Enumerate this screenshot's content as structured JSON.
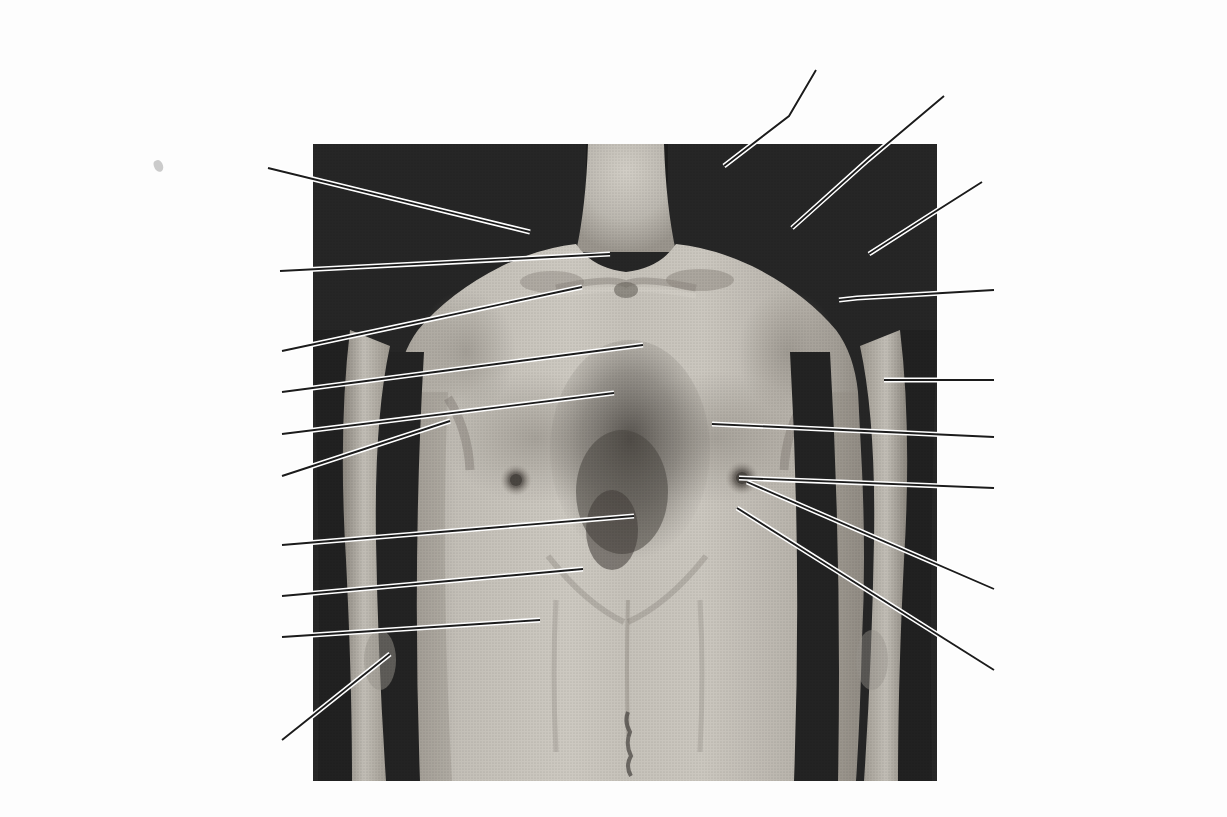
{
  "figure": {
    "background_color": "#fdfdfd",
    "text_color": "#1b1b1b",
    "leader_color": "#1b1b1b",
    "leader_halo_color": "#ffffff"
  },
  "photo": {
    "name": "anterior-thorax-photograph",
    "x": 313,
    "y": 144,
    "width": 624,
    "height": 637,
    "backdrop_color": "#262626",
    "skin_color": "#b9b5ae",
    "shadow_color": "#8d8880",
    "hair_color": "#4a4642"
  },
  "labels": [
    {
      "id": "supraclavicular-fossa",
      "text": [
        "supraclavicular",
        "fossa"
      ],
      "align": "centered",
      "x": 756,
      "y": 36,
      "width": 170
    },
    {
      "id": "clavicle",
      "text": [
        "clavicle"
      ],
      "align": "left",
      "x": 935,
      "y": 78,
      "width": 90
    },
    {
      "id": "trapezius",
      "text": [
        "trapezius"
      ],
      "align": "right",
      "x": 100,
      "y": 157,
      "width": 170
    },
    {
      "id": "acromion-process",
      "text": [
        "acromion process"
      ],
      "align": "left",
      "x": 990,
      "y": 177,
      "width": 180
    },
    {
      "id": "tendon-of-sternocleidomastoid",
      "text": [
        "tendon of",
        "sternocleidomastoid"
      ],
      "align": "right",
      "x": 82,
      "y": 234,
      "width": 188
    },
    {
      "id": "sternal-angle",
      "text": [
        "sternal angle",
        "(angle of Louis)"
      ],
      "align": "left",
      "x": 1003,
      "y": 272,
      "width": 170
    },
    {
      "id": "suprasternal-notch",
      "text": [
        "suprasternal notch"
      ],
      "align": "right",
      "x": 102,
      "y": 341,
      "width": 168
    },
    {
      "id": "deltoid",
      "text": [
        "deltoid"
      ],
      "align": "left",
      "x": 1003,
      "y": 368,
      "width": 90
    },
    {
      "id": "manubrium-sterni",
      "text": [
        "manubrium sterni"
      ],
      "align": "right",
      "x": 112,
      "y": 382,
      "width": 158
    },
    {
      "id": "body-of-sternum",
      "text": [
        "body of sternum"
      ],
      "align": "right",
      "x": 103,
      "y": 424,
      "width": 167
    },
    {
      "id": "pectoralis-major",
      "text": [
        "pectoralis major"
      ],
      "align": "left",
      "x": 1003,
      "y": 425,
      "width": 170
    },
    {
      "id": "anterior-axillary-fold",
      "text": [
        "anterior",
        "axillary fold"
      ],
      "align": "right",
      "x": 112,
      "y": 452,
      "width": 158
    },
    {
      "id": "nipple",
      "text": [
        "nipple"
      ],
      "align": "left",
      "x": 1003,
      "y": 476,
      "width": 90
    },
    {
      "id": "xiphoid-process",
      "text": [
        "xiphoid process"
      ],
      "align": "right",
      "x": 103,
      "y": 534,
      "width": 157
    },
    {
      "id": "costal-margin",
      "text": [
        "costal margin"
      ],
      "align": "right",
      "x": 112,
      "y": 586,
      "width": 148
    },
    {
      "id": "areola",
      "text": [
        "areola"
      ],
      "align": "left",
      "x": 1003,
      "y": 581,
      "width": 90
    },
    {
      "id": "linea-semilunaris",
      "text": [
        "linea semilunaris"
      ],
      "align": "right",
      "x": 82,
      "y": 628,
      "width": 188
    },
    {
      "id": "site-of-apex-beat-of-heart",
      "text": [
        "site of apex",
        "beat of heart"
      ],
      "align": "left",
      "x": 1003,
      "y": 662,
      "width": 160
    },
    {
      "id": "cubital-fossa",
      "text": [
        "cubital fossa"
      ],
      "align": "right",
      "x": 112,
      "y": 730,
      "width": 148
    }
  ],
  "leaders": [
    {
      "id": "leader-supraclavicular-fossa",
      "points": "816,70 789,116 724,166"
    },
    {
      "id": "leader-clavicle",
      "points": "944,96 868,160 792,228"
    },
    {
      "id": "leader-trapezius",
      "points": "268,168 530,232"
    },
    {
      "id": "leader-acromion-process",
      "points": "982,182 930,215 869,254"
    },
    {
      "id": "leader-tendon-of-sternocleidomastoid",
      "points": "280,271 610,254"
    },
    {
      "id": "leader-sternal-angle",
      "points": "994,290 857,298 839,300"
    },
    {
      "id": "leader-suprasternal-notch",
      "points": "282,351 582,287"
    },
    {
      "id": "leader-deltoid",
      "points": "994,380 884,380"
    },
    {
      "id": "leader-manubrium-sterni",
      "points": "282,392 643,345"
    },
    {
      "id": "leader-body-of-sternum",
      "points": "282,434 614,393"
    },
    {
      "id": "leader-pectoralis-major",
      "points": "994,437 712,424"
    },
    {
      "id": "leader-anterior-axillary-fold",
      "points": "282,476 450,421"
    },
    {
      "id": "leader-nipple",
      "points": "994,488 739,478"
    },
    {
      "id": "leader-xiphoid-process",
      "points": "282,545 634,516"
    },
    {
      "id": "leader-costal-margin",
      "points": "282,596 583,569"
    },
    {
      "id": "leader-areola",
      "points": "994,589 747,482"
    },
    {
      "id": "leader-linea-semilunaris",
      "points": "282,637 540,620"
    },
    {
      "id": "leader-site-of-apex-beat-of-heart",
      "points": "994,670 737,508"
    },
    {
      "id": "leader-cubital-fossa",
      "points": "282,740 390,654"
    }
  ]
}
